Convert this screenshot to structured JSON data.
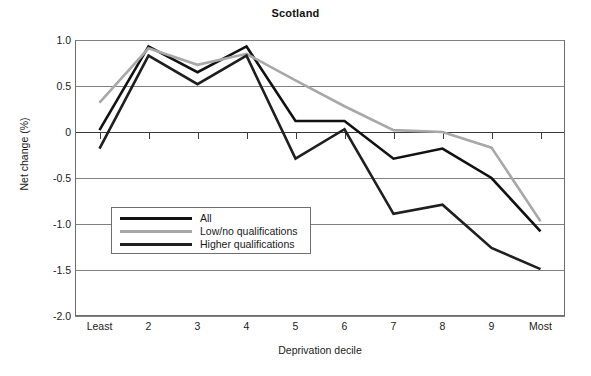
{
  "chart_data": {
    "type": "line",
    "title": "Scotland",
    "xlabel": "Deprivation decile",
    "ylabel": "Net change (%)",
    "categories": [
      "Least",
      "2",
      "3",
      "4",
      "5",
      "6",
      "7",
      "8",
      "9",
      "Most"
    ],
    "x_tick_labels": [
      "Least",
      "2",
      "3",
      "4",
      "5",
      "6",
      "7",
      "8",
      "9",
      "Most"
    ],
    "y_tick_labels": [
      "1.0",
      "0.5",
      "0",
      "-0.5",
      "-1.0",
      "-1.5",
      "-2.0"
    ],
    "y_tick_values": [
      1.0,
      0.5,
      0,
      -0.5,
      -1.0,
      -1.5,
      -2.0
    ],
    "ylim": [
      -2.0,
      1.0
    ],
    "grid": "horizontal",
    "legend_position": "inside-lower-left",
    "series": [
      {
        "name": "All",
        "color": "#111111",
        "values": [
          0.02,
          0.93,
          0.65,
          0.93,
          0.12,
          0.12,
          -0.29,
          -0.18,
          -0.5,
          -1.08
        ]
      },
      {
        "name": "Low/no qualifications",
        "color": "#a8a8a8",
        "values": [
          0.32,
          0.91,
          0.73,
          0.85,
          0.56,
          0.28,
          0.02,
          0.0,
          -0.17,
          -0.97
        ]
      },
      {
        "name": "Higher qualifications",
        "color": "#1f1f1f",
        "values": [
          -0.18,
          0.83,
          0.52,
          0.83,
          -0.29,
          0.03,
          -0.89,
          -0.79,
          -1.26,
          -1.49
        ]
      }
    ]
  },
  "legend": {
    "items": [
      {
        "label": "All"
      },
      {
        "label": "Low/no qualifications"
      },
      {
        "label": "Higher qualifications"
      }
    ]
  }
}
